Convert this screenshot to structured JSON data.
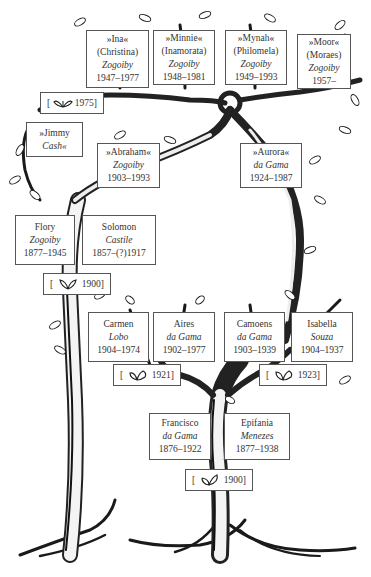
{
  "people": {
    "ina": {
      "line1": "»Ina«",
      "line2": "(Christina)",
      "surname": "Zogoiby",
      "dates": "1947–1977"
    },
    "minnie": {
      "line1": "»Minnie«",
      "line2": "(Inamorata)",
      "surname": "Zogoiby",
      "dates": "1948–1981"
    },
    "mynah": {
      "line1": "»Mynah«",
      "line2": "(Philomela)",
      "surname": "Zogoiby",
      "dates": "1949–1993"
    },
    "moor": {
      "line1": "»Moor«",
      "line2": "(Moraes)",
      "surname": "Zogoiby",
      "dates": "1957–"
    },
    "jimmy": {
      "line1": "»Jimmy",
      "surname": "Cash«"
    },
    "abraham": {
      "line1": "»Abraham«",
      "surname": "Zogoiby",
      "dates": "1903–1993"
    },
    "aurora": {
      "line1": "»Aurora«",
      "surname": "da Gama",
      "dates": "1924–1987"
    },
    "flory": {
      "line1": "Flory",
      "surname": "Zogoiby",
      "dates": "1877–1945"
    },
    "solomon": {
      "line1": "Solomon",
      "surname": "Castile",
      "dates": "1857–(?)1917"
    },
    "carmen": {
      "line1": "Carmen",
      "surname": "Lobo",
      "dates": "1904–1974"
    },
    "aires": {
      "line1": "Aires",
      "surname": "da Gama",
      "dates": "1902–1977"
    },
    "camoens": {
      "line1": "Camoens",
      "surname": "da Gama",
      "dates": "1903–1939"
    },
    "isabella": {
      "line1": "Isabella",
      "surname": "Souza",
      "dates": "1904–1937"
    },
    "francisco": {
      "line1": "Francisco",
      "surname": "da Gama",
      "dates": "1876–1922"
    },
    "epifania": {
      "line1": "Epifania",
      "surname": "Menezes",
      "dates": "1877–1938"
    }
  },
  "marriages": {
    "ina_jimmy": {
      "open": "[",
      "icon": "leaves-icon",
      "year": "1975]"
    },
    "flory_solomon": {
      "open": "[",
      "icon": "leaves-icon",
      "year": "1900]"
    },
    "carmen_aires": {
      "open": "[",
      "icon": "leaves-icon",
      "year": "1921]"
    },
    "camoens_isabella": {
      "open": "[",
      "icon": "leaves-icon",
      "year": "1923]"
    },
    "francisco_epifania": {
      "open": "[",
      "icon": "leaves-icon",
      "year": "1900]"
    }
  },
  "colors": {
    "ink": "#1a1a1a",
    "box_border": "#555555",
    "text": "#333333",
    "background": "#ffffff"
  }
}
